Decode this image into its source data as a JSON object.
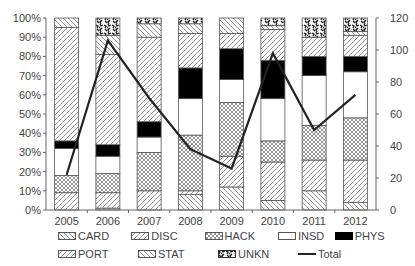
{
  "chart_data": {
    "type": "bar",
    "subtype": "stacked-percent-with-line",
    "title": "",
    "xlabel": "",
    "ylabel": "",
    "categories": [
      "2005",
      "2006",
      "2007",
      "2008",
      "2009",
      "2010",
      "2011",
      "2012"
    ],
    "left_axis": {
      "range": [
        0,
        100
      ],
      "ticks": [
        "0%",
        "10%",
        "20%",
        "30%",
        "40%",
        "50%",
        "60%",
        "70%",
        "80%",
        "90%",
        "100%"
      ]
    },
    "right_axis": {
      "range": [
        0,
        120
      ],
      "ticks": [
        "0",
        "20",
        "40",
        "60",
        "80",
        "100",
        "120"
      ]
    },
    "stack_order_bottom_to_top": [
      "STAT",
      "PORT",
      "HACK",
      "INSD",
      "PHYS",
      "DISC",
      "CARD",
      "UNKN"
    ],
    "series": [
      {
        "name": "STAT",
        "pattern": "hatch-back",
        "values": [
          0,
          1,
          0,
          8,
          12,
          5,
          10,
          4
        ]
      },
      {
        "name": "PORT",
        "pattern": "hatch-fwd",
        "values": [
          9,
          8,
          10,
          2,
          16,
          20,
          16,
          22
        ]
      },
      {
        "name": "HACK",
        "pattern": "crosshatch",
        "values": [
          9,
          10,
          20,
          29,
          28,
          11,
          18,
          22
        ]
      },
      {
        "name": "INSD",
        "pattern": "white",
        "values": [
          14,
          9,
          8,
          19,
          12,
          22,
          26,
          24
        ]
      },
      {
        "name": "PHYS",
        "pattern": "black",
        "values": [
          4,
          6,
          8,
          16,
          16,
          20,
          10,
          8
        ]
      },
      {
        "name": "DISC",
        "pattern": "hatch-fwd",
        "values": [
          59,
          47,
          44,
          18,
          8,
          16,
          10,
          11
        ]
      },
      {
        "name": "CARD",
        "pattern": "hatch-back",
        "values": [
          5,
          10,
          7,
          5,
          8,
          2,
          0,
          2
        ]
      },
      {
        "name": "UNKN",
        "pattern": "speckle",
        "values": [
          0,
          9,
          3,
          3,
          0,
          4,
          10,
          7
        ]
      }
    ],
    "line_series": {
      "name": "Total",
      "axis": "right",
      "values": [
        22,
        106,
        70,
        38,
        26,
        98,
        50,
        72
      ]
    },
    "grid": false,
    "legend_position": "bottom"
  },
  "legend": {
    "row1": [
      "CARD",
      "DISC",
      "HACK",
      "INSD",
      "PHYS"
    ],
    "row2": [
      "PORT",
      "STAT",
      "UNKN",
      "Total"
    ]
  }
}
